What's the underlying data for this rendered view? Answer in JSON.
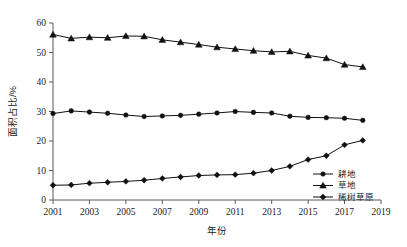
{
  "chart_data": {
    "type": "line",
    "title": "",
    "xlabel": "年份",
    "ylabel": "面积占比/%",
    "xlim": [
      2001,
      2019
    ],
    "ylim": [
      0,
      60
    ],
    "grid": false,
    "legend_position": "bottom-right",
    "x_ticks": [
      "2001",
      "2003",
      "2005",
      "2007",
      "2009",
      "2011",
      "2013",
      "2015",
      "2017",
      "2019"
    ],
    "y_ticks": [
      "0",
      "10",
      "20",
      "30",
      "40",
      "50",
      "60"
    ],
    "x": [
      2001,
      2002,
      2003,
      2004,
      2005,
      2006,
      2007,
      2008,
      2009,
      2010,
      2011,
      2012,
      2013,
      2014,
      2015,
      2016,
      2017,
      2018
    ],
    "series": [
      {
        "name": "耕地",
        "marker": "circle",
        "color": "#111111",
        "values": [
          29.3,
          30.2,
          29.8,
          29.4,
          28.8,
          28.3,
          28.5,
          28.7,
          29.1,
          29.5,
          30.0,
          29.7,
          29.5,
          28.4,
          28.0,
          27.9,
          27.7,
          27.0
        ]
      },
      {
        "name": "草地",
        "marker": "triangle",
        "color": "#111111",
        "values": [
          56.1,
          54.8,
          55.2,
          55.0,
          55.6,
          55.5,
          54.3,
          53.5,
          52.7,
          51.8,
          51.2,
          50.6,
          50.2,
          50.4,
          49.0,
          48.1,
          45.9,
          45.1
        ]
      },
      {
        "name": "稀树草原",
        "marker": "diamond",
        "color": "#111111",
        "values": [
          5.0,
          5.1,
          5.7,
          6.0,
          6.3,
          6.7,
          7.3,
          7.8,
          8.3,
          8.5,
          8.6,
          9.1,
          10.0,
          11.4,
          13.7,
          15.0,
          18.7,
          20.2
        ]
      }
    ]
  }
}
